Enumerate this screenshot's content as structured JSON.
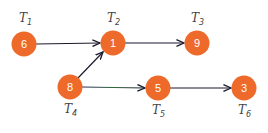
{
  "diagram": {
    "type": "directed-graph",
    "node_color": "#ee6a2a",
    "edge_color": "#1a1a2e",
    "nodes": [
      {
        "id": "T1",
        "task": "T",
        "sub": "1",
        "value": "6",
        "x": 24,
        "y": 44,
        "label_pos": "above"
      },
      {
        "id": "T2",
        "task": "T",
        "sub": "2",
        "value": "1",
        "x": 113,
        "y": 43,
        "label_pos": "above"
      },
      {
        "id": "T3",
        "task": "T",
        "sub": "3",
        "value": "9",
        "x": 197,
        "y": 43,
        "label_pos": "above"
      },
      {
        "id": "T4",
        "task": "T",
        "sub": "4",
        "value": "8",
        "x": 70,
        "y": 87,
        "label_pos": "below"
      },
      {
        "id": "T5",
        "task": "T",
        "sub": "5",
        "value": "5",
        "x": 158,
        "y": 88,
        "label_pos": "below"
      },
      {
        "id": "T6",
        "task": "T",
        "sub": "6",
        "value": "3",
        "x": 244,
        "y": 88,
        "label_pos": "below"
      }
    ],
    "edges": [
      {
        "from": "T1",
        "to": "T2"
      },
      {
        "from": "T2",
        "to": "T3"
      },
      {
        "from": "T4",
        "to": "T2"
      },
      {
        "from": "T4",
        "to": "T5"
      },
      {
        "from": "T5",
        "to": "T6"
      }
    ]
  }
}
